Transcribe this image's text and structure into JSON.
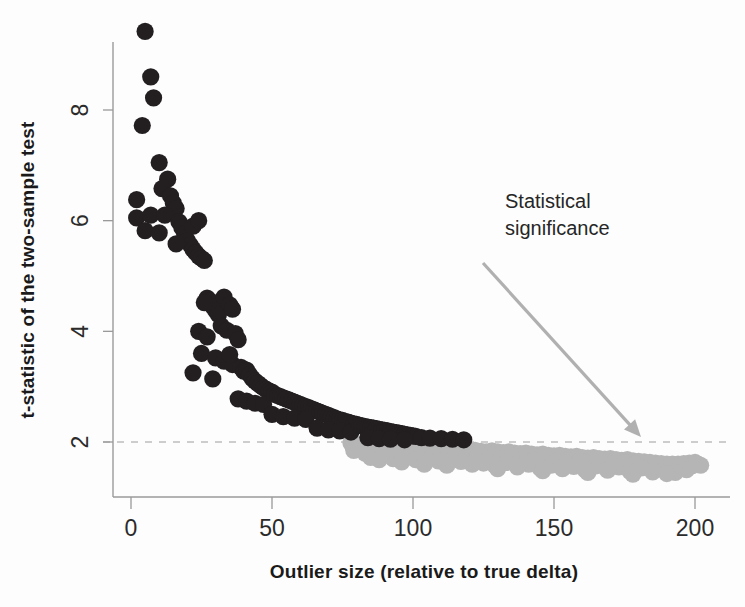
{
  "chart_data": {
    "type": "scatter",
    "title": "",
    "xlabel": "Outlier size (relative to true delta)",
    "ylabel": "t-statistic of the two-sample test",
    "xlim": [
      -4,
      205
    ],
    "ylim": [
      1.1,
      9.9
    ],
    "xticks": [
      0,
      50,
      100,
      150,
      200
    ],
    "xticklabels": [
      "0",
      "50",
      "100",
      "150",
      "200"
    ],
    "yticks": [
      2,
      4,
      6,
      8
    ],
    "yticklabels": [
      "2",
      "4",
      "6",
      "8"
    ],
    "grid": false,
    "legend": null,
    "annotations": [
      {
        "text_line1": "Statistical",
        "text_line2": "significance",
        "text_x": 505,
        "text_y": 208,
        "arrow_from": [
          483,
          263
        ],
        "arrow_to": [
          641,
          437
        ]
      }
    ],
    "reference_lines": [
      {
        "name": "significance-threshold",
        "orientation": "horizontal",
        "value": 2,
        "style": "dashed",
        "color": "#bdbdbd"
      }
    ],
    "series": [
      {
        "name": "significant",
        "color": "#231f20",
        "marker": "circle",
        "points": [
          [
            5,
            9.42
          ],
          [
            7,
            8.6
          ],
          [
            8,
            8.22
          ],
          [
            4,
            7.72
          ],
          [
            10,
            7.05
          ],
          [
            13,
            6.75
          ],
          [
            11,
            6.58
          ],
          [
            2,
            6.38
          ],
          [
            2,
            6.05
          ],
          [
            7,
            6.1
          ],
          [
            14,
            6.45
          ],
          [
            15,
            6.32
          ],
          [
            16,
            6.22
          ],
          [
            12,
            6.1
          ],
          [
            17,
            5.98
          ],
          [
            5,
            5.82
          ],
          [
            10,
            5.78
          ],
          [
            18,
            5.88
          ],
          [
            19,
            5.76
          ],
          [
            20,
            5.64
          ],
          [
            21,
            5.56
          ],
          [
            22,
            5.48
          ],
          [
            23,
            5.42
          ],
          [
            24,
            5.36
          ],
          [
            25,
            5.32
          ],
          [
            22,
            5.9
          ],
          [
            24,
            6.0
          ],
          [
            16,
            5.58
          ],
          [
            26,
            5.28
          ],
          [
            27,
            4.6
          ],
          [
            28,
            4.55
          ],
          [
            29,
            4.45
          ],
          [
            30,
            4.38
          ],
          [
            31,
            4.3
          ],
          [
            26,
            4.52
          ],
          [
            33,
            4.62
          ],
          [
            35,
            4.48
          ],
          [
            36,
            4.4
          ],
          [
            24,
            4.0
          ],
          [
            27,
            3.9
          ],
          [
            32,
            4.1
          ],
          [
            34,
            4.02
          ],
          [
            37,
            3.96
          ],
          [
            38,
            3.85
          ],
          [
            25,
            3.6
          ],
          [
            30,
            3.52
          ],
          [
            33,
            3.46
          ],
          [
            36,
            3.4
          ],
          [
            39,
            3.35
          ],
          [
            40,
            3.28
          ],
          [
            22,
            3.25
          ],
          [
            29,
            3.14
          ],
          [
            35,
            3.58
          ],
          [
            41,
            3.3
          ],
          [
            42,
            3.22
          ],
          [
            43,
            3.15
          ],
          [
            44,
            3.1
          ],
          [
            45,
            3.06
          ],
          [
            46,
            3.02
          ],
          [
            47,
            2.98
          ],
          [
            48,
            2.95
          ],
          [
            49,
            2.92
          ],
          [
            50,
            2.9
          ],
          [
            38,
            2.78
          ],
          [
            41,
            2.74
          ],
          [
            44,
            2.7
          ],
          [
            47,
            2.68
          ],
          [
            51,
            2.86
          ],
          [
            52,
            2.84
          ],
          [
            53,
            2.82
          ],
          [
            54,
            2.8
          ],
          [
            55,
            2.78
          ],
          [
            56,
            2.76
          ],
          [
            57,
            2.74
          ],
          [
            58,
            2.72
          ],
          [
            59,
            2.7
          ],
          [
            60,
            2.68
          ],
          [
            61,
            2.66
          ],
          [
            62,
            2.64
          ],
          [
            63,
            2.62
          ],
          [
            64,
            2.6
          ],
          [
            65,
            2.58
          ],
          [
            66,
            2.56
          ],
          [
            50,
            2.5
          ],
          [
            54,
            2.46
          ],
          [
            58,
            2.43
          ],
          [
            62,
            2.41
          ],
          [
            67,
            2.54
          ],
          [
            68,
            2.52
          ],
          [
            69,
            2.5
          ],
          [
            70,
            2.48
          ],
          [
            71,
            2.46
          ],
          [
            72,
            2.44
          ],
          [
            73,
            2.42
          ],
          [
            74,
            2.4
          ],
          [
            75,
            2.39
          ],
          [
            76,
            2.37
          ],
          [
            77,
            2.36
          ],
          [
            78,
            2.34
          ],
          [
            79,
            2.33
          ],
          [
            80,
            2.32
          ],
          [
            66,
            2.25
          ],
          [
            70,
            2.22
          ],
          [
            74,
            2.2
          ],
          [
            78,
            2.18
          ],
          [
            81,
            2.3
          ],
          [
            82,
            2.29
          ],
          [
            83,
            2.28
          ],
          [
            84,
            2.27
          ],
          [
            85,
            2.26
          ],
          [
            86,
            2.25
          ],
          [
            87,
            2.24
          ],
          [
            88,
            2.23
          ],
          [
            89,
            2.22
          ],
          [
            90,
            2.21
          ],
          [
            91,
            2.2
          ],
          [
            92,
            2.19
          ],
          [
            93,
            2.18
          ],
          [
            94,
            2.17
          ],
          [
            95,
            2.16
          ],
          [
            96,
            2.15
          ],
          [
            97,
            2.14
          ],
          [
            98,
            2.13
          ],
          [
            99,
            2.12
          ],
          [
            100,
            2.11
          ],
          [
            84,
            2.08
          ],
          [
            88,
            2.06
          ],
          [
            92,
            2.05
          ],
          [
            101,
            2.1
          ],
          [
            103,
            2.08
          ],
          [
            106,
            2.07
          ],
          [
            110,
            2.06
          ],
          [
            114,
            2.05
          ],
          [
            97,
            2.04
          ],
          [
            118,
            2.04
          ]
        ]
      },
      {
        "name": "not-significant",
        "color": "#b5b5b5",
        "marker": "circle",
        "points": [
          [
            78,
            1.98
          ],
          [
            80,
            1.96
          ],
          [
            82,
            1.95
          ],
          [
            84,
            1.94
          ],
          [
            86,
            1.95
          ],
          [
            88,
            1.93
          ],
          [
            90,
            1.92
          ],
          [
            92,
            1.93
          ],
          [
            94,
            1.91
          ],
          [
            96,
            1.9
          ],
          [
            98,
            1.92
          ],
          [
            100,
            1.9
          ],
          [
            102,
            1.89
          ],
          [
            104,
            1.9
          ],
          [
            106,
            1.88
          ],
          [
            108,
            1.87
          ],
          [
            110,
            1.88
          ],
          [
            112,
            1.86
          ],
          [
            114,
            1.85
          ],
          [
            116,
            1.87
          ],
          [
            118,
            1.86
          ],
          [
            120,
            1.84
          ],
          [
            122,
            1.85
          ],
          [
            124,
            1.83
          ],
          [
            126,
            1.82
          ],
          [
            128,
            1.84
          ],
          [
            130,
            1.82
          ],
          [
            132,
            1.81
          ],
          [
            134,
            1.82
          ],
          [
            136,
            1.8
          ],
          [
            138,
            1.79
          ],
          [
            140,
            1.8
          ],
          [
            142,
            1.78
          ],
          [
            144,
            1.77
          ],
          [
            146,
            1.78
          ],
          [
            148,
            1.76
          ],
          [
            150,
            1.75
          ],
          [
            152,
            1.76
          ],
          [
            154,
            1.74
          ],
          [
            156,
            1.73
          ],
          [
            158,
            1.74
          ],
          [
            160,
            1.72
          ],
          [
            162,
            1.71
          ],
          [
            164,
            1.72
          ],
          [
            166,
            1.7
          ],
          [
            168,
            1.69
          ],
          [
            170,
            1.7
          ],
          [
            172,
            1.68
          ],
          [
            174,
            1.67
          ],
          [
            176,
            1.68
          ],
          [
            178,
            1.66
          ],
          [
            180,
            1.65
          ],
          [
            182,
            1.64
          ],
          [
            184,
            1.63
          ],
          [
            186,
            1.62
          ],
          [
            188,
            1.61
          ],
          [
            190,
            1.6
          ],
          [
            192,
            1.6
          ],
          [
            194,
            1.6
          ],
          [
            196,
            1.61
          ],
          [
            198,
            1.62
          ],
          [
            200,
            1.63
          ],
          [
            201,
            1.6
          ],
          [
            79,
            1.85
          ],
          [
            83,
            1.8
          ],
          [
            87,
            1.82
          ],
          [
            91,
            1.78
          ],
          [
            95,
            1.8
          ],
          [
            99,
            1.76
          ],
          [
            103,
            1.78
          ],
          [
            107,
            1.75
          ],
          [
            111,
            1.76
          ],
          [
            115,
            1.74
          ],
          [
            119,
            1.72
          ],
          [
            123,
            1.74
          ],
          [
            127,
            1.71
          ],
          [
            131,
            1.7
          ],
          [
            135,
            1.72
          ],
          [
            139,
            1.69
          ],
          [
            143,
            1.68
          ],
          [
            147,
            1.69
          ],
          [
            151,
            1.66
          ],
          [
            155,
            1.67
          ],
          [
            159,
            1.65
          ],
          [
            163,
            1.64
          ],
          [
            167,
            1.65
          ],
          [
            171,
            1.62
          ],
          [
            175,
            1.63
          ],
          [
            179,
            1.61
          ],
          [
            183,
            1.6
          ],
          [
            187,
            1.59
          ],
          [
            191,
            1.57
          ],
          [
            195,
            1.56
          ],
          [
            199,
            1.57
          ],
          [
            202,
            1.58
          ],
          [
            85,
            1.72
          ],
          [
            93,
            1.7
          ],
          [
            101,
            1.68
          ],
          [
            109,
            1.66
          ],
          [
            117,
            1.65
          ],
          [
            125,
            1.62
          ],
          [
            133,
            1.63
          ],
          [
            141,
            1.6
          ],
          [
            149,
            1.58
          ],
          [
            157,
            1.56
          ],
          [
            165,
            1.57
          ],
          [
            173,
            1.55
          ],
          [
            181,
            1.53
          ],
          [
            189,
            1.5
          ],
          [
            197,
            1.5
          ],
          [
            121,
            1.6
          ],
          [
            129,
            1.58
          ],
          [
            137,
            1.55
          ],
          [
            145,
            1.53
          ],
          [
            153,
            1.52
          ],
          [
            161,
            1.5
          ],
          [
            169,
            1.49
          ],
          [
            177,
            1.47
          ],
          [
            185,
            1.46
          ],
          [
            193,
            1.45
          ],
          [
            130,
            1.52
          ],
          [
            146,
            1.48
          ],
          [
            162,
            1.45
          ],
          [
            178,
            1.42
          ],
          [
            190,
            1.43
          ],
          [
            112,
            1.58
          ],
          [
            104,
            1.6
          ],
          [
            96,
            1.64
          ],
          [
            88,
            1.68
          ]
        ]
      }
    ]
  },
  "axis": {
    "x_title": "Outlier size (relative to true delta)",
    "y_title": "t-statistic of the two-sample test"
  },
  "annotation": {
    "line1": "Statistical",
    "line2": "significance"
  },
  "colors": {
    "significant": "#231f20",
    "not_significant": "#b5b5b5",
    "axis": "#9a9a9a",
    "reference_line": "#bdbdbd",
    "arrow": "#b0b0b0",
    "background": "#fdfdfd"
  }
}
